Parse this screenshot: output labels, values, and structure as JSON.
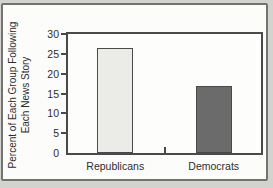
{
  "figure": {
    "outer_background": "#d2d2cf",
    "panel_background": "#fcfcfb",
    "frame_border_color": "#737370"
  },
  "chart_data": {
    "type": "bar",
    "title": "",
    "categories": [
      "Republicans",
      "Democrats"
    ],
    "values": [
      26.5,
      17
    ],
    "bar_colors": [
      "#ebebe8",
      "#6b6b6b"
    ],
    "bar_border_color": "#4a4a4a",
    "ylabel": "Percent of Each Group Following Each News Story",
    "ylabel_lines": [
      "Percent of Each Group Following",
      "Each News Story"
    ],
    "xlabel": "",
    "ylim": [
      0,
      30
    ],
    "yticks": [
      0,
      5,
      10,
      15,
      20,
      25,
      30
    ],
    "grid": false,
    "legend": "none",
    "axis_color": "#4a4a4a",
    "text_color": "#2d2d2d"
  }
}
